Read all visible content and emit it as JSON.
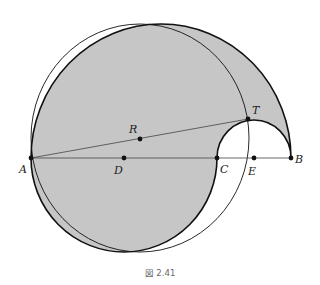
{
  "figure": {
    "caption": "図 2.41",
    "fill_color": "#c6c6c6",
    "stroke_color": "#111111",
    "points": {
      "A": {
        "label": "A",
        "x": 31,
        "y": 158
      },
      "B": {
        "label": "B",
        "x": 291,
        "y": 158
      },
      "C": {
        "label": "C",
        "x": 217,
        "y": 158
      },
      "D": {
        "label": "D",
        "x": 124,
        "y": 158
      },
      "E": {
        "label": "E",
        "x": 254,
        "y": 158
      },
      "T": {
        "label": "T",
        "x": 248,
        "y": 119
      },
      "R": {
        "label": "R",
        "x": 140,
        "y": 139
      }
    }
  }
}
